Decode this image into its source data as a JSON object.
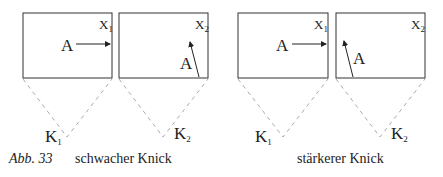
{
  "figure": {
    "label": "Abb. 33",
    "panels": [
      {
        "caption": "schwacher Knick",
        "box1_label": "X",
        "box1_sub": "1",
        "box2_label": "X",
        "box2_sub": "2",
        "vector_label": "A",
        "k1": "K",
        "k1_sub": "1",
        "k2": "K",
        "k2_sub": "2"
      },
      {
        "caption": "stärkerer Knick",
        "box1_label": "X",
        "box1_sub": "1",
        "box2_label": "X",
        "box2_sub": "2",
        "vector_label": "A",
        "k1": "K",
        "k1_sub": "1",
        "k2": "K",
        "k2_sub": "2"
      }
    ]
  }
}
